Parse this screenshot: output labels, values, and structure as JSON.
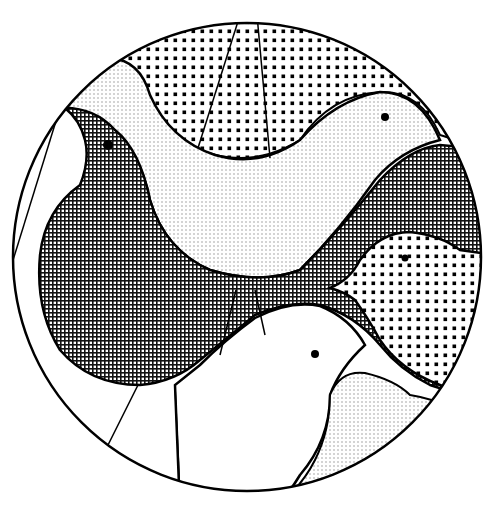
{
  "illustration": {
    "subject": "stylized birds within a circle",
    "style": "black and white line art with halftone and crosshatch fills",
    "colors": {
      "ink": "#000000",
      "paper": "#ffffff"
    },
    "elements": [
      {
        "name": "top-sky-segment",
        "fill": "coarse-dots"
      },
      {
        "name": "light-bird-top",
        "fill": "fine-dots",
        "has_eye": true
      },
      {
        "name": "dark-bird-left",
        "fill": "crosshatch",
        "has_eye": true
      },
      {
        "name": "small-bird-right",
        "fill": "coarse-dots",
        "has_eye": true
      },
      {
        "name": "white-bird-bottom",
        "fill": "none",
        "has_eye": true
      },
      {
        "name": "bottom-right-segment",
        "fill": "fine-dots"
      },
      {
        "name": "left-white-segments",
        "fill": "none"
      }
    ]
  }
}
